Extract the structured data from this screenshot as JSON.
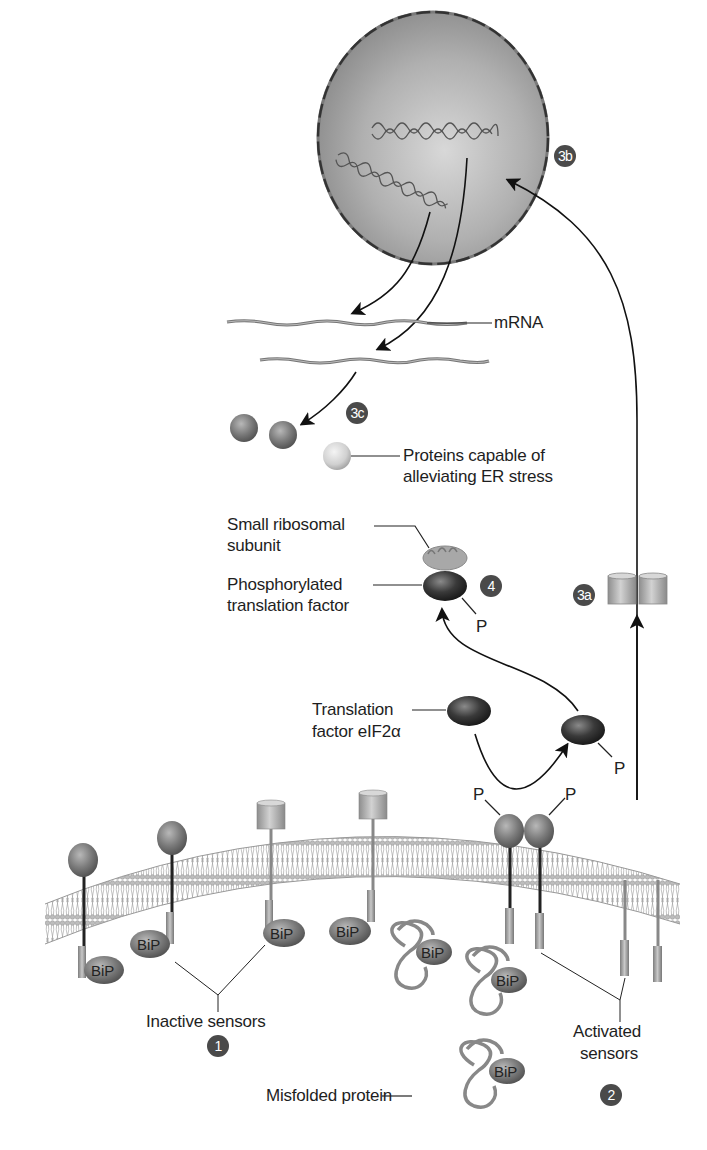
{
  "diagram": {
    "labels": {
      "mrna": "mRNA",
      "proteins_capable_line1": "Proteins capable of",
      "proteins_capable_line2": "alleviating ER stress",
      "small_ribosomal_line1": "Small ribosomal",
      "small_ribosomal_line2": "subunit",
      "phosphorylated_line1": "Phosphorylated",
      "phosphorylated_line2": "translation factor",
      "translation_factor_line1": "Translation",
      "translation_factor_line2": "factor eIF2α",
      "inactive_sensors": "Inactive sensors",
      "activated_line1": "Activated",
      "activated_line2": "sensors",
      "misfolded_protein": "Misfolded protein",
      "bip": "BiP",
      "phosphate": "P"
    },
    "steps": [
      {
        "id": "1",
        "label": "1"
      },
      {
        "id": "2",
        "label": "2"
      },
      {
        "id": "3a",
        "label": "3a"
      },
      {
        "id": "3b",
        "label": "3b"
      },
      {
        "id": "3c",
        "label": "3c"
      },
      {
        "id": "4",
        "label": "4"
      }
    ],
    "colors": {
      "badge": "#4a4a4a",
      "nucleus": "#9a9a9a",
      "membrane": "#a8a8a8",
      "protein_dark": "#3a3a3a",
      "bip": "#7a7a7a"
    }
  }
}
